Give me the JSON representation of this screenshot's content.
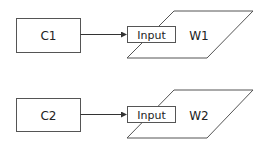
{
  "diagram": {
    "rows": [
      {
        "component": {
          "label": "C1"
        },
        "input": {
          "label": "Input"
        },
        "window": {
          "label": "W1"
        }
      },
      {
        "component": {
          "label": "C2"
        },
        "input": {
          "label": "Input"
        },
        "window": {
          "label": "W2"
        }
      }
    ],
    "colors": {
      "stroke": "#555555",
      "text": "#222222",
      "background": "#ffffff"
    }
  }
}
